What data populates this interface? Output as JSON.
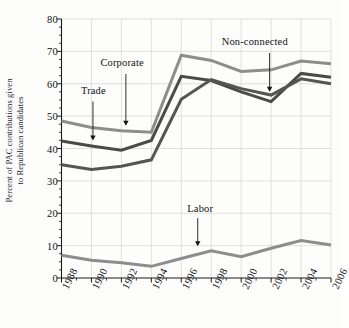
{
  "chart_data": {
    "type": "line",
    "title": "",
    "xlabel": "",
    "ylabel_line1": "Percent of PAC contributions given",
    "ylabel_line2": "to Republican candidates",
    "x": [
      1988,
      1990,
      1992,
      1994,
      1996,
      1998,
      2000,
      2002,
      2004,
      2006
    ],
    "xtick_labels": [
      "1988",
      "1990",
      "1992",
      "1994",
      "1996",
      "1998",
      "2000",
      "2002",
      "2004",
      "2006"
    ],
    "ytick_labels": [
      "0",
      "10",
      "20",
      "30",
      "40",
      "50",
      "60",
      "70",
      "80"
    ],
    "ytick_values": [
      0,
      10,
      20,
      30,
      40,
      50,
      60,
      70,
      80
    ],
    "yminor_step": 2.5,
    "ylim": [
      0,
      80
    ],
    "xlim": [
      1988,
      2006
    ],
    "grid": true,
    "grid_color": "#d8d8d8",
    "legend_position": "inline-annotations",
    "series": [
      {
        "name": "Corporate",
        "color": "#8d8d8d",
        "values": [
          48.5,
          46.5,
          45.5,
          45.0,
          68.8,
          67.2,
          63.8,
          64.3,
          67.0,
          66.2
        ]
      },
      {
        "name": "Trade",
        "color": "#4a4a4a",
        "values": [
          42.3,
          40.8,
          39.5,
          42.5,
          62.3,
          61.0,
          57.5,
          54.5,
          63.2,
          62.0
        ]
      },
      {
        "name": "Non-connected",
        "color": "#555555",
        "values": [
          35.0,
          33.5,
          34.5,
          36.5,
          55.2,
          61.3,
          58.5,
          56.5,
          61.5,
          60.0
        ]
      },
      {
        "name": "Labor",
        "color": "#8d8d8d",
        "values": [
          7.0,
          5.5,
          4.7,
          3.6,
          6.0,
          8.4,
          6.6,
          9.2,
          11.6,
          10.2
        ]
      }
    ],
    "annotations": [
      {
        "text": "Trade",
        "label_x": 1989.3,
        "label_y": 57.5,
        "arrow_x": 1990.1,
        "arrow_y0": 54.5,
        "arrow_y1": 42.5
      },
      {
        "text": "Corporate",
        "label_x": 1990.6,
        "label_y": 66.0,
        "arrow_x": 1992.3,
        "arrow_y0": 63.0,
        "arrow_y1": 47.0
      },
      {
        "text": "Non-connected",
        "label_x": 1998.7,
        "label_y": 72.5,
        "arrow_x": 2001.9,
        "arrow_y0": 69.5,
        "arrow_y1": 57.5
      },
      {
        "text": "Labor",
        "label_x": 1996.4,
        "label_y": 21.0,
        "arrow_x": 1997.1,
        "arrow_y0": 18.5,
        "arrow_y1": 9.8
      }
    ]
  }
}
